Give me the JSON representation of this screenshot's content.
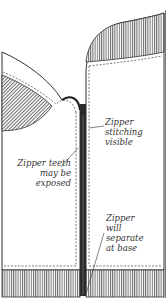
{
  "diagram": {
    "colors": {
      "outline": "#333333",
      "hatch": "#777777",
      "zipper": "#2a2a2a",
      "fabric": "#ffffff",
      "text": "#333333"
    },
    "labels": {
      "stitching": [
        "Zipper",
        "stitching",
        "visible"
      ],
      "teeth": [
        "Zipper teeth",
        "may be",
        "exposed"
      ],
      "base": [
        "Zipper",
        "will",
        "separate",
        "at base"
      ]
    }
  }
}
